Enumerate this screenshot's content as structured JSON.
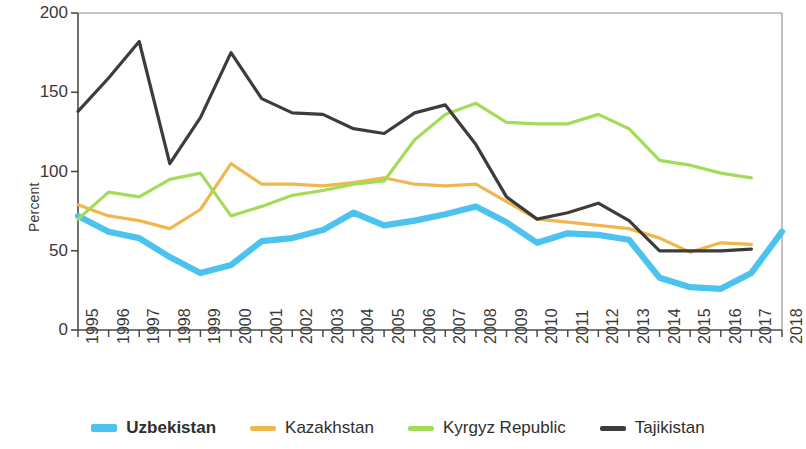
{
  "chart_data": {
    "type": "line",
    "title": "",
    "xlabel": "",
    "ylabel": "Percent",
    "ylim": [
      0,
      200
    ],
    "yticks": [
      0,
      50,
      100,
      150,
      200
    ],
    "grid": false,
    "legend_position": "bottom",
    "categories": [
      "1995",
      "1996",
      "1997",
      "1998",
      "1999",
      "2000",
      "2001",
      "2002",
      "2003",
      "2004",
      "2005",
      "2006",
      "2007",
      "2008",
      "2009",
      "2010",
      "2011",
      "2012",
      "2013",
      "2014",
      "2015",
      "2016",
      "2017",
      "2018"
    ],
    "series": [
      {
        "name": "Uzbekistan",
        "color": "#4BC3EE",
        "emphasis": true,
        "values": [
          72,
          62,
          58,
          46,
          36,
          41,
          56,
          58,
          63,
          74,
          66,
          69,
          73,
          78,
          68,
          55,
          61,
          60,
          57,
          33,
          27,
          26,
          36,
          62
        ]
      },
      {
        "name": "Kazakhstan",
        "color": "#F0B74E",
        "emphasis": false,
        "values": [
          79,
          72,
          69,
          64,
          76,
          105,
          92,
          92,
          91,
          93,
          96,
          92,
          91,
          92,
          81,
          70,
          68,
          66,
          64,
          58,
          49,
          55,
          54,
          null
        ]
      },
      {
        "name": "Kyrgyz Republic",
        "color": "#A2DC5A",
        "emphasis": false,
        "values": [
          70,
          87,
          84,
          95,
          99,
          72,
          78,
          85,
          88,
          92,
          94,
          120,
          136,
          143,
          131,
          130,
          130,
          136,
          127,
          107,
          104,
          99,
          96,
          null
        ]
      },
      {
        "name": "Tajikistan",
        "color": "#3C3C3A",
        "emphasis": false,
        "values": [
          138,
          159,
          182,
          105,
          134,
          175,
          146,
          137,
          136,
          127,
          124,
          137,
          142,
          117,
          84,
          70,
          74,
          80,
          69,
          50,
          50,
          50,
          51,
          null
        ]
      }
    ]
  },
  "legend": {
    "items": [
      {
        "label": "Uzbekistan"
      },
      {
        "label": "Kazakhstan"
      },
      {
        "label": "Kyrgyz Republic"
      },
      {
        "label": "Tajikistan"
      }
    ]
  }
}
